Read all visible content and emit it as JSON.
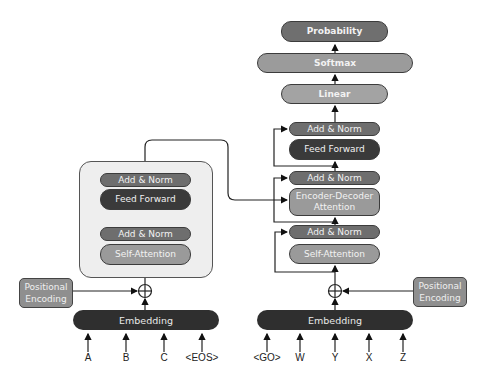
{
  "encoder": {
    "add_norm_top": "Add & Norm",
    "feed_forward": "Feed Forward",
    "add_norm_bottom": "Add & Norm",
    "self_attention": "Self-Attention",
    "positional_encoding": "Positional Encoding",
    "embedding": "Embedding",
    "inputs": [
      "A",
      "B",
      "C",
      "<EOS>"
    ]
  },
  "decoder": {
    "add_norm_top": "Add & Norm",
    "feed_forward": "Feed Forward",
    "add_norm_mid": "Add & Norm",
    "encoder_decoder_attention": "Encoder-Decoder Attention",
    "add_norm_bottom": "Add & Norm",
    "self_attention": "Self-Attention",
    "positional_encoding": "Positional Encoding",
    "embedding": "Embedding",
    "inputs": [
      "<GO>",
      "W",
      "Y",
      "X",
      "Z"
    ]
  },
  "output": {
    "linear": "Linear",
    "softmax": "Softmax",
    "probability": "Probability"
  },
  "colors": {
    "dark_layer": "#3a3a3a",
    "norm_layer": "#6e6e6e",
    "attention_layer": "#9a9a9a",
    "block_bg": "#eeeeee"
  }
}
